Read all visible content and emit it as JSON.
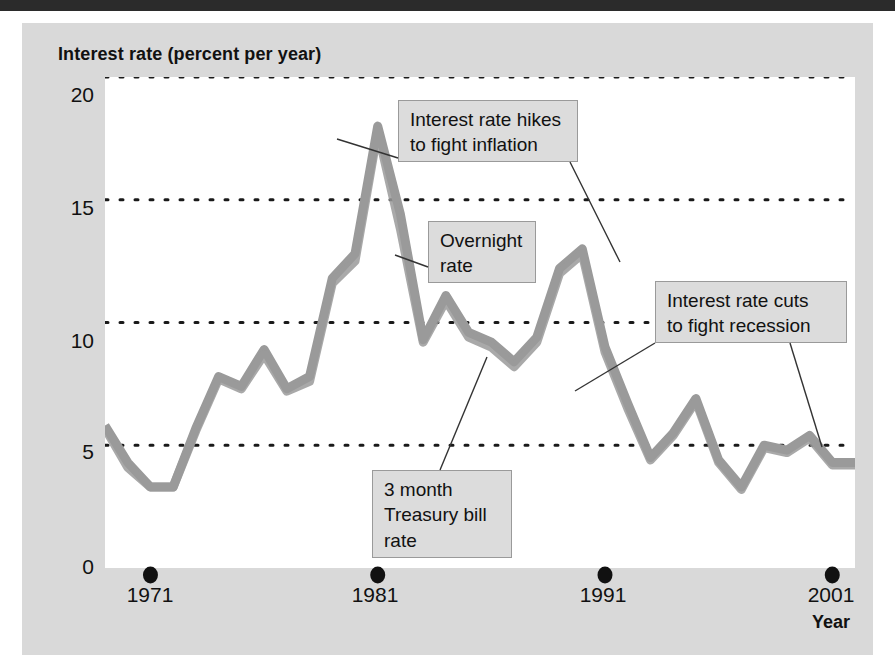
{
  "chart_title": "Interest rate (percent per year)",
  "axes": {
    "y_ticks": [
      "20",
      "15",
      "10",
      "5",
      "0"
    ],
    "y_values": [
      20,
      15,
      10,
      5,
      0
    ],
    "x_ticks": [
      "1971",
      "1981",
      "1991",
      "2001"
    ],
    "x_values": [
      1971,
      1981,
      1991,
      2001
    ],
    "x_axis_label": "Year"
  },
  "annotations": {
    "hikes": "Interest rate hikes\nto fight inflation",
    "overnight": "Overnight\nrate",
    "cuts": "Interest rate cuts\nto fight recession",
    "tbill": "3 month\nTreasury bill\nrate"
  },
  "colors": {
    "series": "#9a9a9a",
    "gridline": "#1a1a1a",
    "plot_background": "#ffffff",
    "figure_background": "#d9d9d9",
    "text": "#111111",
    "annotation_background": "#dcdcdc",
    "annotation_border": "#9a9a9a",
    "top_band": "#2b2b2b"
  },
  "chart_data": {
    "type": "line",
    "title": "Interest rate (percent per year)",
    "xlabel": "Year",
    "ylabel": "Interest rate (percent per year)",
    "xlim": [
      1969,
      2002
    ],
    "ylim": [
      0,
      20
    ],
    "grid": "horizontal-dotted",
    "legend": "none (inline labels)",
    "x": [
      1969,
      1970,
      1971,
      1972,
      1973,
      1974,
      1975,
      1976,
      1977,
      1978,
      1979,
      1980,
      1981,
      1982,
      1983,
      1984,
      1985,
      1986,
      1987,
      1988,
      1989,
      1990,
      1991,
      1992,
      1993,
      1994,
      1995,
      1996,
      1997,
      1998,
      1999,
      2000,
      2001,
      2002
    ],
    "series": [
      {
        "name": "Overnight rate",
        "values": [
          5.8,
          4.3,
          3.3,
          3.3,
          5.7,
          7.8,
          7.4,
          8.9,
          7.3,
          7.8,
          11.8,
          12.8,
          18.0,
          14.4,
          9.3,
          11.1,
          9.6,
          9.2,
          8.4,
          9.4,
          12.2,
          13.0,
          9.0,
          6.7,
          4.5,
          5.5,
          6.9,
          4.4,
          3.3,
          5.0,
          4.8,
          5.4,
          4.3,
          4.3
        ]
      },
      {
        "name": "3 month Treasury bill rate",
        "values": [
          5.7,
          4.1,
          3.3,
          3.3,
          5.6,
          7.7,
          7.3,
          8.7,
          7.2,
          7.6,
          11.6,
          12.5,
          17.8,
          13.8,
          9.2,
          10.9,
          9.4,
          9.0,
          8.2,
          9.2,
          12.0,
          12.8,
          8.8,
          6.5,
          4.4,
          5.4,
          6.8,
          4.3,
          3.2,
          4.9,
          4.7,
          5.3,
          4.2,
          4.2
        ]
      }
    ],
    "annotations": [
      {
        "text": "Interest rate hikes to fight inflation",
        "points_to_year": 1990,
        "points_to_value": 13.0
      },
      {
        "text": "Overnight rate",
        "points_to_year": 1982,
        "points_to_value": 12.4
      },
      {
        "text": "3 month Treasury bill rate",
        "points_to_year": 1986,
        "points_to_value": 9.0
      },
      {
        "text": "Interest rate cuts to fight recession",
        "points_to_year": 2001,
        "points_to_value": 4.3
      }
    ]
  }
}
